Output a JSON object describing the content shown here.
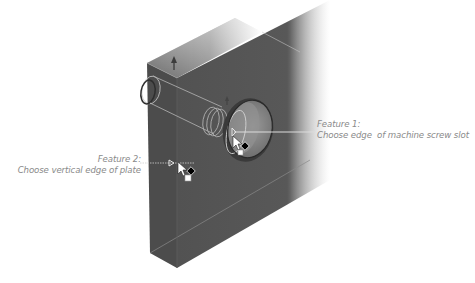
{
  "diagram": {
    "colors": {
      "background": "#ffffff",
      "plate_face": "#545454",
      "plate_top": "#727272",
      "plate_side": "#4a4a4a",
      "hole_inner": "#8c8c8c",
      "edge_highlight": "#b9b9b9",
      "callout_text": "#8a8a8a",
      "leader_line": "#d0d0d0"
    },
    "callouts": [
      {
        "id": "feature-1",
        "title": "Feature 1:",
        "instruction": "Choose edge  of machine screw slot",
        "target": "machine screw slot edge",
        "icons": [
          "select-pointer-icon",
          "edge-select-diamond-icon",
          "face-select-square-icon"
        ]
      },
      {
        "id": "feature-2",
        "title": "Feature 2:",
        "instruction": "Choose vertical edge of plate",
        "target": "vertical edge of plate",
        "icons": [
          "select-pointer-icon",
          "edge-select-diamond-icon",
          "face-select-square-icon"
        ]
      }
    ]
  }
}
